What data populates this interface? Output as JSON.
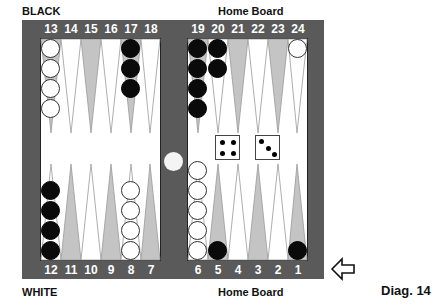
{
  "labels": {
    "top_left": "BLACK",
    "top_right": "Home Board",
    "bottom_left": "WHITE",
    "bottom_right": "Home Board",
    "caption": "Diag. 14"
  },
  "colors": {
    "frame": "#5a5a5a",
    "field": "#ffffff",
    "dark_point": "#c4c4c4",
    "light_point": "#ffffff",
    "black_checker": "#0a0a0a",
    "white_checker": "#ffffff"
  },
  "top_points": [
    "13",
    "14",
    "15",
    "16",
    "17",
    "18",
    "19",
    "20",
    "21",
    "22",
    "23",
    "24"
  ],
  "bottom_points": [
    "12",
    "11",
    "10",
    "9",
    "8",
    "7",
    "6",
    "5",
    "4",
    "3",
    "2",
    "1"
  ],
  "position": {
    "13": {
      "color": "white",
      "count": 4
    },
    "17": {
      "color": "black",
      "count": 3
    },
    "19": {
      "color": "black",
      "count": 4
    },
    "20": {
      "color": "black",
      "count": 2
    },
    "24": {
      "color": "white",
      "count": 1
    },
    "12": {
      "color": "black",
      "count": 4
    },
    "8": {
      "color": "white",
      "count": 4
    },
    "6": {
      "color": "white",
      "count": 5
    },
    "5": {
      "color": "black",
      "count": 1
    },
    "1": {
      "color": "black",
      "count": 1
    },
    "bar": {
      "color": "white",
      "count": 1
    }
  },
  "dice": [
    4,
    3
  ],
  "direction_arrow": "left-arrow-icon"
}
